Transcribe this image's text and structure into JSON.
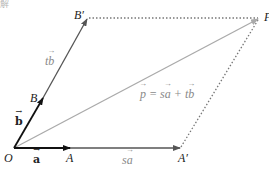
{
  "corner_text": "解",
  "colors": {
    "vector_dark": "#111111",
    "vector_mid": "#555555",
    "diagonal": "#aaaaaa",
    "dotted": "#777777"
  },
  "points": {
    "O": {
      "label": "O",
      "x": 14,
      "y": 148
    },
    "A": {
      "label": "A",
      "x": 70,
      "y": 148
    },
    "A_prime": {
      "label": "A′",
      "x": 180,
      "y": 148
    },
    "B": {
      "label": "B",
      "x": 43,
      "y": 98
    },
    "B_prime": {
      "label": "B′",
      "x": 87,
      "y": 18
    },
    "P": {
      "label": "P",
      "x": 260,
      "y": 18
    }
  },
  "labels": {
    "vec_a": "a",
    "vec_b": "b",
    "sa_s": "s",
    "sa_a": "a",
    "tb_t": "t",
    "tb_b": "b",
    "p_eq_p": "p",
    "p_eq_rest": " = s",
    "p_eq_a": "a",
    "p_eq_plus": " + t",
    "p_eq_b": "b"
  }
}
